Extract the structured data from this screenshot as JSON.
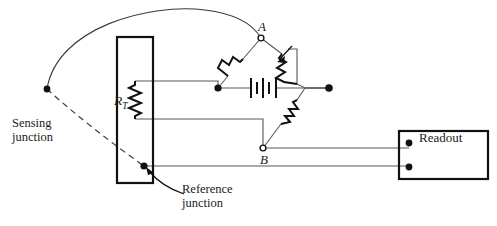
{
  "figure": {
    "type": "circuit-schematic",
    "canvas": {
      "width": 497,
      "height": 226,
      "background": "#ffffff"
    }
  },
  "labels": {
    "sensing_junction_line1": "Sensing",
    "sensing_junction_line2": "junction",
    "reference_junction_line1": "Reference",
    "reference_junction_line2": "junction",
    "readout": "Readout",
    "node_a": "A",
    "node_b": "B",
    "rt_symbol": "R",
    "rt_subscript": "T"
  },
  "components": {
    "sensing_element_box": {
      "name": "sensing-element-enclosure",
      "x": 117,
      "y": 37,
      "width": 36,
      "height": 146
    },
    "readout_box": {
      "name": "readout-enclosure",
      "x": 399,
      "y": 131,
      "width": 89,
      "height": 48
    },
    "rt_resistor": {
      "name": "rt-thermistor",
      "orientation": "vertical",
      "x": 135,
      "y_top": 81,
      "y_bottom": 119
    },
    "bridge_resistor_left": {
      "name": "bridge-resistor-left",
      "orientation": "diagonal",
      "from": [
        261,
        38
      ],
      "to": [
        218,
        88
      ]
    },
    "bridge_resistor_variable": {
      "name": "bridge-resistor-variable",
      "orientation": "diagonal",
      "from": [
        261,
        38
      ],
      "to": [
        305,
        88
      ],
      "has_adjust_arrow": true
    },
    "bridge_resistor_bottom": {
      "name": "bridge-resistor-bottom",
      "orientation": "diagonal",
      "from": [
        305,
        88
      ],
      "to": [
        263,
        148
      ]
    },
    "battery": {
      "name": "bridge-excitation-battery",
      "cx": 263,
      "cy": 88,
      "plates": 4
    }
  },
  "nodes": {
    "node_a": {
      "x": 261,
      "y": 38,
      "style": "open"
    },
    "node_b": {
      "x": 263,
      "y": 148,
      "style": "open"
    },
    "bridge_left": {
      "x": 218,
      "y": 88,
      "style": "filled"
    },
    "bridge_right": {
      "x": 329,
      "y": 88,
      "style": "filled"
    },
    "sensing_junction": {
      "x": 47,
      "y": 89,
      "style": "filled"
    },
    "reference_junction": {
      "x": 144,
      "y": 166,
      "style": "filled"
    },
    "readout_terminal_top": {
      "x": 409,
      "y": 143,
      "style": "filled"
    },
    "readout_terminal_bottom": {
      "x": 409,
      "y": 167,
      "style": "filled"
    }
  },
  "colors": {
    "wire": "#58585a",
    "ink": "#111111",
    "lead": "#3a3a3a",
    "background": "#ffffff"
  }
}
